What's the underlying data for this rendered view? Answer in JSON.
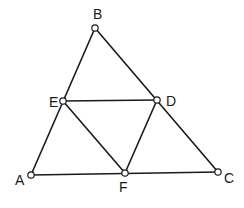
{
  "diagram": {
    "type": "geometry",
    "colors": {
      "line": "#1a1a1a",
      "point_fill": "#ffffff",
      "background": "#ffffff"
    },
    "points": [
      {
        "id": "B",
        "label": "B",
        "x": 95,
        "y": 28,
        "lx": 93,
        "ly": 19
      },
      {
        "id": "E",
        "label": "E",
        "x": 63,
        "y": 101,
        "lx": 49,
        "ly": 107
      },
      {
        "id": "D",
        "label": "D",
        "x": 157,
        "y": 100,
        "lx": 166,
        "ly": 106
      },
      {
        "id": "A",
        "label": "A",
        "x": 31,
        "y": 175,
        "lx": 15,
        "ly": 185
      },
      {
        "id": "F",
        "label": "F",
        "x": 125,
        "y": 173,
        "lx": 119,
        "ly": 192
      },
      {
        "id": "C",
        "label": "C",
        "x": 218,
        "y": 172,
        "lx": 224,
        "ly": 183
      }
    ],
    "segments": [
      [
        "A",
        "B"
      ],
      [
        "B",
        "C"
      ],
      [
        "A",
        "C"
      ],
      [
        "E",
        "D"
      ],
      [
        "E",
        "F"
      ],
      [
        "D",
        "F"
      ]
    ]
  }
}
